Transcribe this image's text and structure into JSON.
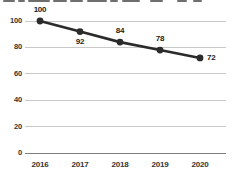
{
  "title_clipped": {
    "note": "title text cut off by top edge of screenshot (only glyph bottoms visible)",
    "segments": [
      [
        3,
        12
      ],
      [
        18,
        7
      ],
      [
        28,
        22
      ],
      [
        53,
        14
      ],
      [
        70,
        13
      ],
      [
        87,
        20
      ],
      [
        110,
        8
      ],
      [
        122,
        18
      ],
      [
        150,
        13
      ],
      [
        177,
        10
      ],
      [
        193,
        9
      ]
    ]
  },
  "chart_data": {
    "type": "line",
    "categories": [
      "2016",
      "2017",
      "2018",
      "2019",
      "2020"
    ],
    "values": [
      100,
      92,
      84,
      78,
      72
    ],
    "data_label_positions": [
      "above",
      "below",
      "above",
      "above",
      "right"
    ],
    "y_ticks": [
      100,
      80,
      60,
      40,
      20,
      0
    ],
    "ylim": [
      0,
      100
    ],
    "grid": true,
    "legend": false,
    "title": "",
    "xlabel": "",
    "ylabel": "",
    "colors": {
      "line": "#2b2b2b",
      "marker": "#2b2b2b",
      "gridline": "#c9c9c9",
      "axis_line": "#7d7d7d",
      "data_label": "#1c1c1c",
      "tick_label": "#333333",
      "background": "#ffffff"
    }
  }
}
